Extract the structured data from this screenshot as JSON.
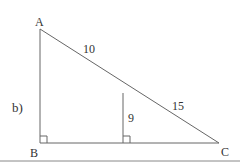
{
  "part_label": "b)",
  "vertices": {
    "A": "A",
    "B": "B",
    "C": "C"
  },
  "measures": {
    "upper_hyp": "10",
    "lower_hyp": "15",
    "inner_height": "9"
  },
  "colors": {
    "line": "#555555",
    "text": "#333333"
  }
}
